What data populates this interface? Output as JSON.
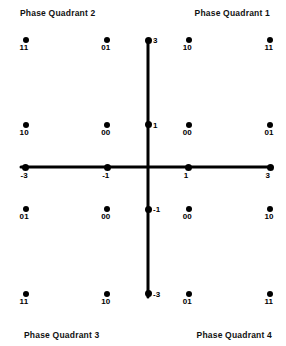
{
  "figure": {
    "title": "",
    "quadrant_labels": {
      "q1": "Phase Quadrant 1",
      "q2": "Phase Quadrant 2",
      "q3": "Phase Quadrant 3",
      "q4": "Phase Quadrant 4"
    }
  },
  "chart_data": {
    "type": "scatter",
    "title": "",
    "xlabel": "",
    "ylabel": "",
    "xlim": [
      -4,
      4
    ],
    "ylim": [
      -4,
      4
    ],
    "grid": false,
    "legend": "none",
    "axis_style": "crossed-axes-through-origin",
    "xticks": [
      -3,
      -1,
      1,
      3
    ],
    "xtick_labels": [
      "-3",
      "-1",
      "1",
      "3"
    ],
    "yticks": [
      3,
      1,
      -1,
      -3
    ],
    "ytick_labels": [
      "3",
      "1",
      "-1",
      "-3"
    ],
    "annotations": [
      "Phase Quadrant 1",
      "Phase Quadrant 2",
      "Phase Quadrant 3",
      "Phase Quadrant 4"
    ],
    "point_label_kind": "2-bit-symbol",
    "points": [
      {
        "x": -3,
        "y": 3,
        "label": "11"
      },
      {
        "x": -1,
        "y": 3,
        "label": "01"
      },
      {
        "x": 1,
        "y": 3,
        "label": "10"
      },
      {
        "x": 3,
        "y": 3,
        "label": "11"
      },
      {
        "x": -3,
        "y": 1,
        "label": "10"
      },
      {
        "x": -1,
        "y": 1,
        "label": "00"
      },
      {
        "x": 1,
        "y": 1,
        "label": "00"
      },
      {
        "x": 3,
        "y": 1,
        "label": "01"
      },
      {
        "x": -3,
        "y": -1,
        "label": "01"
      },
      {
        "x": -1,
        "y": -1,
        "label": "00"
      },
      {
        "x": 1,
        "y": -1,
        "label": "00"
      },
      {
        "x": 3,
        "y": -1,
        "label": "10"
      },
      {
        "x": -3,
        "y": -3,
        "label": "11"
      },
      {
        "x": -1,
        "y": -3,
        "label": "10"
      },
      {
        "x": 1,
        "y": -3,
        "label": "01"
      },
      {
        "x": 3,
        "y": -3,
        "label": "11"
      }
    ],
    "axis_endpoint_markers": {
      "x": [
        -3,
        -1,
        1,
        3
      ],
      "y": [
        3,
        1,
        -1,
        -3
      ]
    }
  },
  "colors": {
    "background": "#ffffff",
    "ink": "#000000",
    "marker": "#000000"
  }
}
